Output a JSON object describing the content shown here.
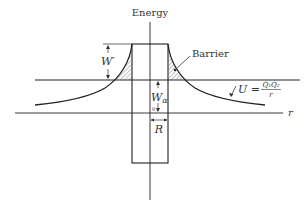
{
  "figure": {
    "axis_labels": {
      "y": "Energy",
      "x": "r"
    },
    "annotations": {
      "barrier": "Barrier",
      "w_prime": "W′",
      "w_alpha_main": "W",
      "w_alpha_sub": "α",
      "origin": "0",
      "radius": "R",
      "potential_lhs": "U =",
      "potential_num": "Q₁Q₂",
      "potential_den": "r"
    },
    "colors": {
      "line": "#222222",
      "hatch": "#555555",
      "background": "#ffffff"
    }
  }
}
